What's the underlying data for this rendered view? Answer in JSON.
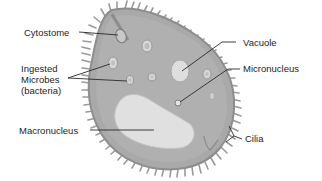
{
  "diagram": {
    "colors": {
      "cytoplasm": "#a9a9a9",
      "membrane": "#8d8d8d",
      "cilia": "#9a9a9a",
      "organelle_fill": "#dcdcdc",
      "macronucleus": "#e2e2e2",
      "leader_line": "#2a2a2a",
      "text": "#1e1e1e"
    },
    "labels": {
      "cytostome": "Cytostome",
      "ingested_microbes_line1": "Ingested",
      "ingested_microbes_line2": "Microbes",
      "ingested_microbes_line3": "(bacteria)",
      "vacuole": "Vacuole",
      "micronucleus": "Micronucleus",
      "macronucleus": "Macronucleus",
      "cilia": "Cilia"
    }
  }
}
